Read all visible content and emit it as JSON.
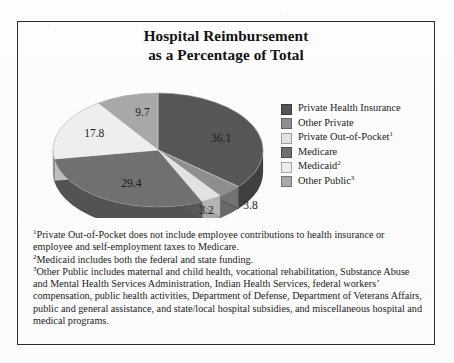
{
  "figure": {
    "title_line1": "Hospital Reimbursement",
    "title_line2": "as a Percentage of Total",
    "frame_color": "#2c2c2c",
    "background": "#ffffff"
  },
  "legend": {
    "items": [
      {
        "label": "Private Health Insurance",
        "sup": "",
        "color": "#565656"
      },
      {
        "label": "Other Private",
        "sup": "",
        "color": "#8e8e8e"
      },
      {
        "label": "Private Out-of-Pocket",
        "sup": "1",
        "color": "#e2e2e2"
      },
      {
        "label": "Medicare",
        "sup": "",
        "color": "#6f6f6f"
      },
      {
        "label": "Medicaid",
        "sup": "2",
        "color": "#eeeeee"
      },
      {
        "label": "Other Public",
        "sup": "3",
        "color": "#a8a8a8"
      }
    ]
  },
  "footnotes": [
    {
      "marker": "1",
      "text": "Private Out-of-Pocket does not include employee contributions to health insurance or employee and self-employment taxes to Medicare."
    },
    {
      "marker": "2",
      "text": "Medicaid includes both the federal and state funding."
    },
    {
      "marker": "3",
      "text": "Other Public includes maternal and child health, vocational rehabilitation, Substance Abuse and Mental Health Services Administration, Indian Health Services, federal workers’ compensation, public health activities, Department of Defense, Department of Veterans Affairs, public and general assistance, and state/local hospital subsidies, and miscellaneous hospital and medical programs."
    }
  ],
  "chart_data": {
    "type": "pie",
    "title": "Hospital Reimbursement as a Percentage of Total",
    "three_d": true,
    "unit": "percent",
    "labels": [
      "Private Health Insurance",
      "Other Private",
      "Private Out-of-Pocket",
      "Medicare",
      "Medicaid",
      "Other Public"
    ],
    "values": [
      36.1,
      3.8,
      3.2,
      29.4,
      17.8,
      9.7
    ],
    "value_labels": [
      "36.1",
      "3.8",
      "3.2",
      "29.4",
      "17.8",
      "9.7"
    ],
    "colors": [
      "#565656",
      "#8e8e8e",
      "#e2e2e2",
      "#6f6f6f",
      "#eeeeee",
      "#a8a8a8"
    ],
    "start_angle_deg": 0,
    "direction": "clockwise",
    "legend_position": "right",
    "grid": false
  }
}
